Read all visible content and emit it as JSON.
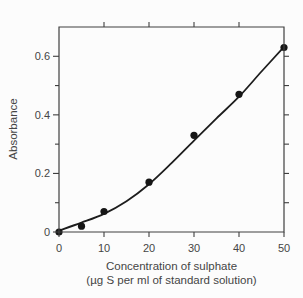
{
  "chart_data": {
    "type": "scatter",
    "title": "",
    "ylabel": "Absorbance",
    "xlabel_line1": "Concentration of sulphate",
    "xlabel_line2": "(µg S per ml of standard solution)",
    "xlim": [
      0,
      50
    ],
    "ylim": [
      0,
      0.7
    ],
    "grid": false,
    "legend": "none",
    "x_ticks": [
      0,
      10,
      20,
      30,
      40,
      50
    ],
    "x_tick_labels": [
      "0",
      "10",
      "20",
      "30",
      "40",
      "50"
    ],
    "y_ticks": [
      0,
      0.2,
      0.4,
      0.6
    ],
    "y_tick_labels": [
      "0",
      "0.2",
      "0.4",
      "0.6"
    ],
    "y_minor_ticks": [
      0.1,
      0.3,
      0.5
    ],
    "top_axis_ticks": [
      10,
      20,
      30,
      40
    ],
    "right_axis_ticks": [
      0.1,
      0.2,
      0.3,
      0.4,
      0.5,
      0.6
    ],
    "series": [
      {
        "name": "measured-standards",
        "marker": "filled-circle",
        "x": [
          0,
          5,
          10,
          20,
          30,
          40,
          50
        ],
        "y": [
          0.0,
          0.02,
          0.07,
          0.17,
          0.33,
          0.47,
          0.63
        ]
      }
    ],
    "fit_curve": {
      "x": [
        0,
        5,
        10,
        15,
        20,
        25,
        30,
        35,
        40,
        45,
        50
      ],
      "y": [
        0.005,
        0.032,
        0.062,
        0.105,
        0.163,
        0.235,
        0.312,
        0.388,
        0.462,
        0.548,
        0.632
      ]
    },
    "colors": {
      "axis": "#3f3f3f",
      "text": "#454545",
      "marker": "#161616",
      "curve": "#1d1d1d",
      "background": "#fcfcfc"
    }
  }
}
